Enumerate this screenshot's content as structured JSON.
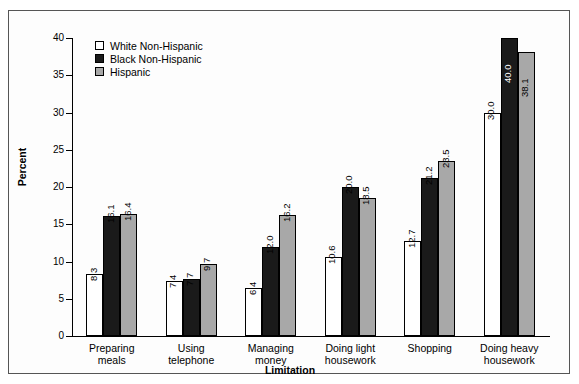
{
  "chart_data": {
    "type": "bar",
    "title": "",
    "xlabel": "Limitation",
    "ylabel": "Percent",
    "ylim": [
      0,
      40
    ],
    "yticks": [
      0,
      5,
      10,
      15,
      20,
      25,
      30,
      35,
      40
    ],
    "grid": false,
    "legend_position": "top-left inside plot",
    "categories": [
      "Preparing meals",
      "Using telephone",
      "Managing money",
      "Doing light housework",
      "Shopping",
      "Doing heavy housework"
    ],
    "category_lines": [
      [
        "Preparing",
        "meals"
      ],
      [
        "Using",
        "telephone"
      ],
      [
        "Managing",
        "money"
      ],
      [
        "Doing light",
        "housework"
      ],
      [
        "Shopping"
      ],
      [
        "Doing heavy",
        "housework"
      ]
    ],
    "series": [
      {
        "name": "White Non-Hispanic",
        "color": "#ffffff",
        "values": [
          8.3,
          7.4,
          6.4,
          10.6,
          12.7,
          30.0
        ],
        "labels": [
          "8.3",
          "7.4",
          "6.4",
          "10.6",
          "12.7",
          "30.0"
        ]
      },
      {
        "name": "Black Non-Hispanic",
        "color": "#1a1a1a",
        "values": [
          16.1,
          7.7,
          12.0,
          20.0,
          21.2,
          40.0
        ],
        "labels": [
          "16.1",
          "7.7",
          "12.0",
          "20.0",
          "21.2",
          "40.0"
        ]
      },
      {
        "name": "Hispanic",
        "color": "#a8a8a8",
        "values": [
          16.4,
          9.7,
          16.2,
          18.5,
          23.5,
          38.1
        ],
        "labels": [
          "16.4",
          "9.7",
          "16.2",
          "18.5",
          "23.5",
          "38.1"
        ]
      }
    ]
  },
  "legend": {
    "items": [
      {
        "label": "White Non-Hispanic",
        "color": "#ffffff"
      },
      {
        "label": "Black Non-Hispanic",
        "color": "#1a1a1a"
      },
      {
        "label": "Hispanic",
        "color": "#a8a8a8"
      }
    ]
  },
  "axes": {
    "y_title": "Percent",
    "x_title": "Limitation",
    "y_tick_labels": [
      "0",
      "5",
      "10",
      "15",
      "20",
      "25",
      "30",
      "35",
      "40"
    ]
  }
}
